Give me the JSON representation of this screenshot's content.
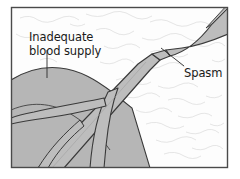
{
  "figure": {
    "type": "medical-illustration",
    "frame": {
      "border_color": "#4a4a4a",
      "background_color": "#ffffff",
      "x": 11,
      "y": 7,
      "width": 217,
      "height": 161
    },
    "colors": {
      "tissue_gray": "#b6b6b6",
      "vessel_gray": "#bdbdbd",
      "outline": "#3a3a3a",
      "texture": "#c9c9c9",
      "label": "#1a1a1a",
      "leader": "#2a2a2a"
    },
    "labels": [
      {
        "id": "inadequate-blood-supply",
        "line1": "Inadequate",
        "line2": "blood supply",
        "x": 29,
        "y": 41,
        "leader": "vertical"
      },
      {
        "id": "spasm",
        "line1": "Spasm",
        "x": 184,
        "y": 73,
        "leader": "diagonal"
      }
    ],
    "anatomy": {
      "ischemic_region": "shaded tissue territory at lower left",
      "main_vessel": "artery running from lower left to upper right",
      "constriction": "narrowed spastic segment upper right",
      "branches": "distal branching vessels within shaded territory"
    }
  }
}
